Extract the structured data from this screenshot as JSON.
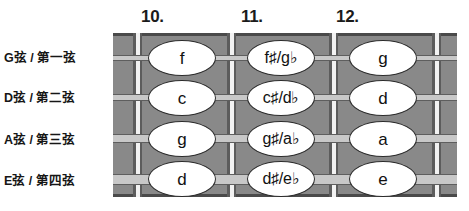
{
  "colors": {
    "fretboard": "#898989",
    "fret_line": "#f2f2f2",
    "string": "#c8c8c8",
    "note_fill": "#ffffff",
    "note_stroke": "#2b2b2b",
    "text": "#111111",
    "background": "#ffffff"
  },
  "fret_numbers": [
    {
      "label": "10.",
      "x": 141
    },
    {
      "label": "11.",
      "x": 241
    },
    {
      "label": "12.",
      "x": 336
    }
  ],
  "strings": [
    {
      "label": "G弦 / 第一弦",
      "label_top": 51,
      "y": 58,
      "thickness": 6
    },
    {
      "label": "D弦 / 第二弦",
      "label_top": 91,
      "y": 97,
      "thickness": 7
    },
    {
      "label": "A弦 / 第三弦",
      "label_top": 133,
      "y": 138,
      "thickness": 9
    },
    {
      "label": "E弦 / 第四弦",
      "label_top": 174,
      "y": 179,
      "thickness": 11
    }
  ],
  "frets": [
    {
      "x": 133
    },
    {
      "x": 227
    },
    {
      "x": 329
    },
    {
      "x": 432
    }
  ],
  "notes": [
    {
      "text": "f",
      "x": 148,
      "y": 40,
      "w": 68,
      "h": 36,
      "wide": false
    },
    {
      "text": "f♯/g♭",
      "x": 247,
      "y": 40,
      "w": 68,
      "h": 36,
      "wide": true
    },
    {
      "text": "g",
      "x": 349,
      "y": 40,
      "w": 68,
      "h": 36,
      "wide": false
    },
    {
      "text": "c",
      "x": 148,
      "y": 80,
      "w": 68,
      "h": 36,
      "wide": false
    },
    {
      "text": "c♯/d♭",
      "x": 247,
      "y": 80,
      "w": 68,
      "h": 36,
      "wide": true
    },
    {
      "text": "d",
      "x": 349,
      "y": 80,
      "w": 68,
      "h": 36,
      "wide": false
    },
    {
      "text": "g",
      "x": 148,
      "y": 121,
      "w": 68,
      "h": 36,
      "wide": false
    },
    {
      "text": "g♯/a♭",
      "x": 247,
      "y": 121,
      "w": 68,
      "h": 36,
      "wide": true
    },
    {
      "text": "a",
      "x": 349,
      "y": 121,
      "w": 68,
      "h": 36,
      "wide": false
    },
    {
      "text": "d",
      "x": 148,
      "y": 161,
      "w": 68,
      "h": 36,
      "wide": false
    },
    {
      "text": "d♯/e♭",
      "x": 247,
      "y": 161,
      "w": 68,
      "h": 36,
      "wide": true
    },
    {
      "text": "e",
      "x": 349,
      "y": 161,
      "w": 68,
      "h": 36,
      "wide": false
    }
  ]
}
